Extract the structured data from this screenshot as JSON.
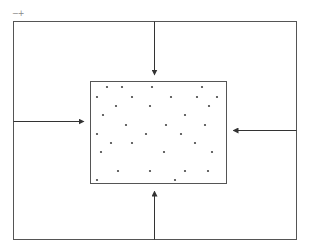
{
  "zoom_controls": {
    "minus": "−",
    "plus": "+"
  },
  "colors": {
    "stroke": "#555555",
    "dot": "#444444",
    "arrow": "#333333"
  },
  "outer_box": {
    "x": 13,
    "y": 21,
    "w": 283,
    "h": 218
  },
  "inner_box": {
    "x": 90,
    "y": 81,
    "w": 136,
    "h": 102
  },
  "arrows": [
    {
      "name": "arrow-top",
      "x1": 154,
      "y1": 21,
      "x2": 154,
      "y2": 74
    },
    {
      "name": "arrow-left",
      "x1": 13,
      "y1": 121,
      "x2": 83,
      "y2": 121
    },
    {
      "name": "arrow-right",
      "x1": 296,
      "y1": 130,
      "x2": 233,
      "y2": 130
    },
    {
      "name": "arrow-bottom",
      "x1": 154,
      "y1": 239,
      "x2": 154,
      "y2": 191
    }
  ],
  "particles": [
    [
      107,
      87
    ],
    [
      122,
      87
    ],
    [
      152,
      87
    ],
    [
      202,
      87
    ],
    [
      97,
      97
    ],
    [
      132,
      97
    ],
    [
      171,
      97
    ],
    [
      197,
      97
    ],
    [
      217,
      97
    ],
    [
      116,
      106
    ],
    [
      150,
      106
    ],
    [
      209,
      106
    ],
    [
      103,
      115
    ],
    [
      185,
      115
    ],
    [
      126,
      125
    ],
    [
      166,
      125
    ],
    [
      205,
      125
    ],
    [
      97,
      134
    ],
    [
      146,
      134
    ],
    [
      181,
      134
    ],
    [
      111,
      143
    ],
    [
      132,
      143
    ],
    [
      195,
      143
    ],
    [
      101,
      152
    ],
    [
      164,
      152
    ],
    [
      212,
      152
    ],
    [
      118,
      171
    ],
    [
      150,
      171
    ],
    [
      185,
      171
    ],
    [
      208,
      171
    ],
    [
      97,
      180
    ],
    [
      175,
      180
    ]
  ]
}
